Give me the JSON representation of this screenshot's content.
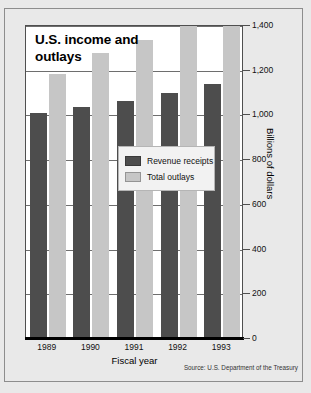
{
  "chart_data": {
    "type": "bar",
    "title": "U.S. income and outlays",
    "xlabel": "Fiscal year",
    "ylabel": "Billions of dollars",
    "categories": [
      "1989",
      "1990",
      "1991",
      "1992",
      "1993"
    ],
    "series": [
      {
        "name": "Revenue receipts",
        "color": "#4d4d4d",
        "values": [
          1000,
          1030,
          1055,
          1090,
          1130
        ]
      },
      {
        "name": "Total outlays",
        "color": "#c6c6c6",
        "values": [
          1175,
          1270,
          1330,
          1390,
          1420
        ]
      }
    ],
    "ylim": [
      0,
      1400
    ],
    "yticks": [
      0,
      200,
      400,
      600,
      800,
      1000,
      1200,
      1400
    ],
    "ytick_labels": [
      "0",
      "200",
      "400",
      "600",
      "800",
      "1,000",
      "1,200",
      "1,400"
    ],
    "grid": true,
    "legend_position": "center-right-inside",
    "source": "Source: U.S. Department of the Treasury"
  },
  "legend": {
    "items": [
      {
        "label": "Revenue receipts",
        "swatch": "revenue"
      },
      {
        "label": "Total outlays",
        "swatch": "outlays"
      }
    ]
  }
}
